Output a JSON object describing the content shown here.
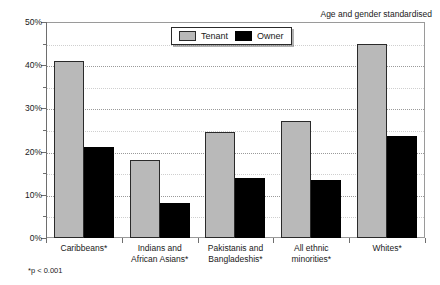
{
  "annotations": {
    "standardised_note": "Age and gender standardised",
    "footnote": "*p < 0.001",
    "top_sliver": ""
  },
  "legend": {
    "entries": [
      {
        "label": "Tenant",
        "color": "#b9b9b9"
      },
      {
        "label": "Owner",
        "color": "#000000"
      }
    ]
  },
  "axis": {
    "y_ticks": [
      "0%",
      "10%",
      "20%",
      "30%",
      "40%",
      "50%"
    ]
  },
  "chart_data": {
    "type": "bar",
    "title": "",
    "subtitle": "",
    "xlabel": "",
    "ylabel": "",
    "ylim": [
      0,
      50
    ],
    "ytick_values": [
      0,
      10,
      20,
      30,
      40,
      50
    ],
    "ytick_labels": [
      "0%",
      "10%",
      "20%",
      "30%",
      "40%",
      "50%"
    ],
    "minor_tick_values": [
      5,
      15,
      25,
      35,
      45
    ],
    "grid": "horizontal-dotted",
    "legend_position": "top-center",
    "categories": [
      "Caribbeans*",
      "Indians and African Asians*",
      "Pakistanis and Bangladeshis*",
      "All ethnic minorities*",
      "Whites*"
    ],
    "category_lines": [
      [
        "Caribbeans*"
      ],
      [
        "Indians and",
        "African Asians*"
      ],
      [
        "Pakistanis and",
        "Bangladeshis*"
      ],
      [
        "All ethnic minorities*"
      ],
      [
        "Whites*"
      ]
    ],
    "series": [
      {
        "name": "Tenant",
        "color": "#b9b9b9",
        "values": [
          41,
          18,
          24.5,
          27,
          45
        ]
      },
      {
        "name": "Owner",
        "color": "#000000",
        "values": [
          21,
          8,
          14,
          13.5,
          23.7
        ]
      }
    ],
    "annotations": [
      "Age and gender standardised",
      "*p < 0.001"
    ]
  }
}
